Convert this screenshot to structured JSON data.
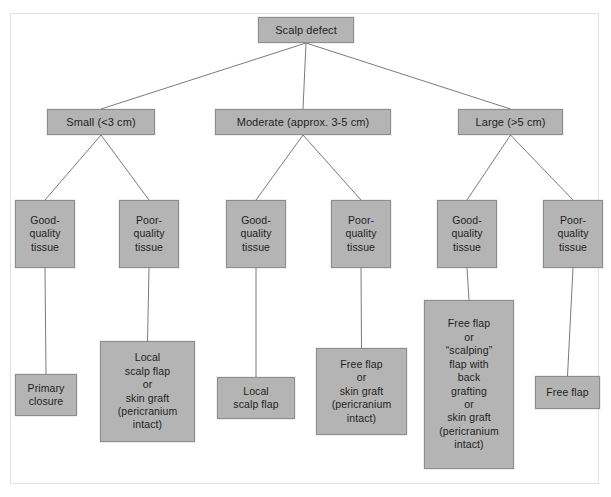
{
  "diagram": {
    "type": "flowchart",
    "box_fill": "#b4b4b4",
    "box_border": "#8d8d8d",
    "connector_color": "#7b7b7b",
    "frame_border": "#e2e2e4",
    "background": "#ffffff"
  },
  "nodes": {
    "root": {
      "label": "Scalp defect",
      "x": 258,
      "y": 17,
      "w": 96,
      "h": 26
    },
    "level2": [
      {
        "id": "small",
        "label": "Small (<3 cm)",
        "x": 47,
        "y": 109,
        "w": 108,
        "h": 26
      },
      {
        "id": "moderate",
        "label": "Moderate (approx. 3-5 cm)",
        "x": 215,
        "y": 109,
        "w": 176,
        "h": 26
      },
      {
        "id": "large",
        "label": "Large (>5 cm)",
        "x": 458,
        "y": 109,
        "w": 105,
        "h": 26
      }
    ],
    "tissue": [
      {
        "id": "small-good",
        "label": "Good-\nquality\ntissue",
        "x": 15,
        "y": 200,
        "w": 60,
        "h": 68
      },
      {
        "id": "small-poor",
        "label": "Poor-\nquality\ntissue",
        "x": 119,
        "y": 200,
        "w": 60,
        "h": 68
      },
      {
        "id": "moderate-good",
        "label": "Good-\nquality\ntissue",
        "x": 226,
        "y": 200,
        "w": 60,
        "h": 68
      },
      {
        "id": "moderate-poor",
        "label": "Poor-\nquality\ntissue",
        "x": 331,
        "y": 200,
        "w": 60,
        "h": 68
      },
      {
        "id": "large-good",
        "label": "Good-\nquality\ntissue",
        "x": 437,
        "y": 200,
        "w": 60,
        "h": 68
      },
      {
        "id": "large-poor",
        "label": "Poor-\nquality\ntissue",
        "x": 543,
        "y": 200,
        "w": 60,
        "h": 68
      }
    ],
    "outcomes": [
      {
        "id": "outcome-primary-closure",
        "label": "Primary\nclosure",
        "x": 15,
        "y": 374,
        "w": 62,
        "h": 42
      },
      {
        "id": "outcome-local-scalp-flap-or-skin-graft",
        "label": "Local\nscalp flap\nor\nskin graft\n(pericranium\nintact)",
        "x": 100,
        "y": 341,
        "w": 95,
        "h": 101
      },
      {
        "id": "outcome-local-scalp-flap",
        "label": "Local\nscalp flap",
        "x": 217,
        "y": 377,
        "w": 78,
        "h": 42
      },
      {
        "id": "outcome-free-flap-or-skin-graft",
        "label": "Free flap\nor\nskin graft\n(pericranium\nintact)",
        "x": 316,
        "y": 348,
        "w": 91,
        "h": 87
      },
      {
        "id": "outcome-free-flap-or-scalping-flap",
        "label": "Free flap\nor\n“scalping”\nflap with\nback\ngrafting\nor\nskin graft\n(pericranium\nintact)",
        "x": 424,
        "y": 300,
        "w": 90,
        "h": 169
      },
      {
        "id": "outcome-free-flap",
        "label": "Free flap",
        "x": 535,
        "y": 376,
        "w": 65,
        "h": 33
      }
    ]
  },
  "edges": [
    {
      "id": "root-to-small",
      "from": "root",
      "to": "small"
    },
    {
      "id": "root-to-moderate",
      "from": "root",
      "to": "moderate"
    },
    {
      "id": "root-to-large",
      "from": "root",
      "to": "large"
    },
    {
      "id": "small-to-good",
      "from": "small",
      "to": "small-good"
    },
    {
      "id": "small-to-poor",
      "from": "small",
      "to": "small-poor"
    },
    {
      "id": "moderate-to-good",
      "from": "moderate",
      "to": "moderate-good"
    },
    {
      "id": "moderate-to-poor",
      "from": "moderate",
      "to": "moderate-poor"
    },
    {
      "id": "large-to-good",
      "from": "large",
      "to": "large-good"
    },
    {
      "id": "large-to-poor",
      "from": "large",
      "to": "large-poor"
    },
    {
      "id": "small-good-to-outcome",
      "from": "small-good",
      "to": "outcome-primary-closure"
    },
    {
      "id": "small-poor-to-outcome",
      "from": "small-poor",
      "to": "outcome-local-scalp-flap-or-skin-graft"
    },
    {
      "id": "moderate-good-to-outcome",
      "from": "moderate-good",
      "to": "outcome-local-scalp-flap"
    },
    {
      "id": "moderate-poor-to-outcome",
      "from": "moderate-poor",
      "to": "outcome-free-flap-or-skin-graft"
    },
    {
      "id": "large-good-to-outcome",
      "from": "large-good",
      "to": "outcome-free-flap-or-scalping-flap"
    },
    {
      "id": "large-poor-to-outcome",
      "from": "large-poor",
      "to": "outcome-free-flap"
    }
  ]
}
